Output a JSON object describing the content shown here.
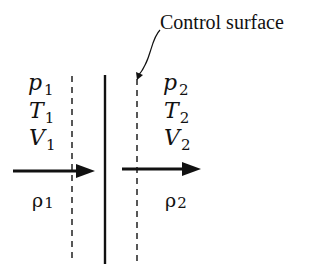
{
  "diagram": {
    "title_label": "Control surface",
    "left_state": {
      "pressure": {
        "symbol": "p",
        "sub": "1"
      },
      "temperature": {
        "symbol": "T",
        "sub": "1"
      },
      "velocity": {
        "symbol": "V",
        "sub": "1"
      },
      "density": {
        "symbol": "ρ",
        "sub": "1"
      }
    },
    "right_state": {
      "pressure": {
        "symbol": "p",
        "sub": "2"
      },
      "temperature": {
        "symbol": "T",
        "sub": "2"
      },
      "velocity": {
        "symbol": "V",
        "sub": "2"
      },
      "density": {
        "symbol": "ρ",
        "sub": "2"
      }
    },
    "elements": {
      "left_dashed_line": "control surface boundary (upstream)",
      "solid_line": "shock wave / discontinuity",
      "right_dashed_line": "control surface boundary (downstream)",
      "left_arrow": "flow direction upstream",
      "right_arrow": "flow direction downstream"
    },
    "colors": {
      "ink": "#111111",
      "background": "#ffffff"
    }
  }
}
